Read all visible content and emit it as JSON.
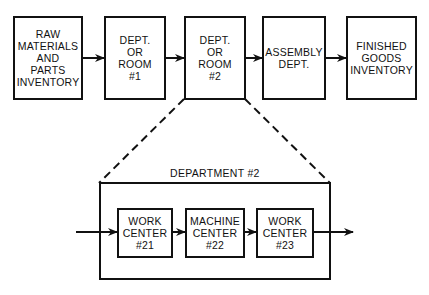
{
  "top_row": [
    {
      "id": "raw-materials",
      "label": "RAW\nMATERIALS\nAND\nPARTS\nINVENTORY"
    },
    {
      "id": "dept-room-1",
      "label": "DEPT.\nOR\nROOM\n#1"
    },
    {
      "id": "dept-room-2",
      "label": "DEPT.\nOR\nROOM\n#2"
    },
    {
      "id": "assembly-dept",
      "label": "ASSEMBLY\nDEPT."
    },
    {
      "id": "finished-goods",
      "label": "FINISHED\nGOODS\nINVENTORY"
    }
  ],
  "detail": {
    "title": "DEPARTMENT #2",
    "centers": [
      {
        "id": "work-center-21",
        "label": "WORK\nCENTER\n#21"
      },
      {
        "id": "machine-center-22",
        "label": "MACHINE\nCENTER\n#22"
      },
      {
        "id": "work-center-23",
        "label": "WORK\nCENTER\n#23"
      }
    ]
  },
  "colors": {
    "line": "#111111",
    "background": "#ffffff"
  }
}
